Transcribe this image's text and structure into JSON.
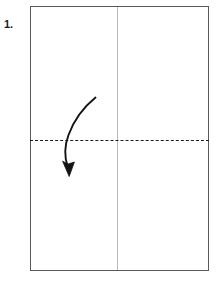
{
  "figure": {
    "step_number": "1.",
    "caption": "",
    "colors": {
      "paper_outline": "#555a5e",
      "existing_crease": "#b9bcbe",
      "fold_line": "#1c1c1c",
      "arrow": "#141414",
      "background": "#ffffff",
      "label_text": "#1a1a1a"
    },
    "paper": {
      "name": "rectangular-sheet",
      "orientation": "portrait"
    },
    "creases": [
      {
        "name": "vertical-center-crease",
        "style": "solid-light",
        "orientation": "vertical",
        "position": "center"
      },
      {
        "name": "horizontal-fold-line",
        "style": "dashed",
        "orientation": "horizontal",
        "position": "center"
      }
    ],
    "arrow": {
      "name": "fold-down-arrow",
      "direction": "down",
      "shape": "curved",
      "meaning": "fold top edge down to bottom edge"
    }
  }
}
